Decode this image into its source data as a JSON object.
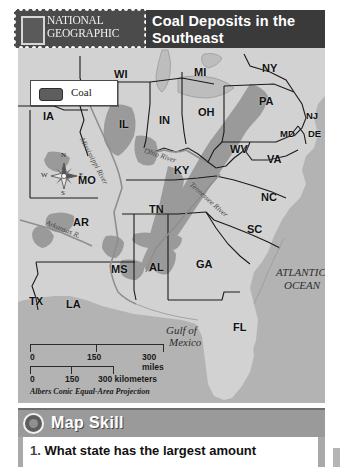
{
  "header": {
    "brand_line1": "NATIONAL",
    "brand_line2": "GEOGRAPHIC",
    "title": "Coal Deposits in the Southeast"
  },
  "legend": {
    "label": "Coal",
    "swatch_color": "#5e5e5e"
  },
  "compass": {
    "north": "N",
    "south": "S",
    "west": "W",
    "east": "E"
  },
  "scale": {
    "miles": {
      "start": "0",
      "mid": "150",
      "end": "300 miles"
    },
    "kilometers": {
      "start": "0",
      "mid": "150",
      "end": "300 kilometers"
    },
    "projection": "Albers Conic Equal-Area Projection"
  },
  "map": {
    "background_color": "#b8b8b8",
    "land_color": "#d2d2d2",
    "coal_color": "#9a9a9a",
    "water_color": "#b3b3b3",
    "states": [
      {
        "abbr": "WI",
        "x": 96,
        "y": 20
      },
      {
        "abbr": "MI",
        "x": 176,
        "y": 18
      },
      {
        "abbr": "NY",
        "x": 244,
        "y": 14
      },
      {
        "abbr": "IA",
        "x": 25,
        "y": 62
      },
      {
        "abbr": "IL",
        "x": 101,
        "y": 70
      },
      {
        "abbr": "IN",
        "x": 141,
        "y": 66
      },
      {
        "abbr": "OH",
        "x": 180,
        "y": 58
      },
      {
        "abbr": "PA",
        "x": 241,
        "y": 47
      },
      {
        "abbr": "NJ",
        "x": 288,
        "y": 62
      },
      {
        "abbr": "MD",
        "x": 262,
        "y": 80
      },
      {
        "abbr": "DE",
        "x": 290,
        "y": 80
      },
      {
        "abbr": "WV",
        "x": 212,
        "y": 95
      },
      {
        "abbr": "VA",
        "x": 249,
        "y": 105
      },
      {
        "abbr": "MO",
        "x": 60,
        "y": 126
      },
      {
        "abbr": "KY",
        "x": 156,
        "y": 116
      },
      {
        "abbr": "NC",
        "x": 243,
        "y": 143
      },
      {
        "abbr": "TN",
        "x": 131,
        "y": 155
      },
      {
        "abbr": "AR",
        "x": 55,
        "y": 168
      },
      {
        "abbr": "SC",
        "x": 229,
        "y": 175
      },
      {
        "abbr": "MS",
        "x": 93,
        "y": 215
      },
      {
        "abbr": "AL",
        "x": 131,
        "y": 213
      },
      {
        "abbr": "GA",
        "x": 178,
        "y": 210
      },
      {
        "abbr": "TX",
        "x": 11,
        "y": 247
      },
      {
        "abbr": "LA",
        "x": 48,
        "y": 250
      },
      {
        "abbr": "FL",
        "x": 215,
        "y": 273
      }
    ],
    "water_labels": [
      {
        "text": "ATLANTIC",
        "x": 258,
        "y": 218
      },
      {
        "text": "OCEAN",
        "x": 266,
        "y": 231
      },
      {
        "text": "Gulf of",
        "x": 148,
        "y": 276
      },
      {
        "text": "Mexico",
        "x": 151,
        "y": 288
      }
    ],
    "rivers": [
      {
        "name": "Mississippi River",
        "x": 68,
        "y": 88,
        "rotate": 62
      },
      {
        "name": "Ohio River",
        "x": 128,
        "y": 98,
        "rotate": 18
      },
      {
        "name": "Tennessee River",
        "x": 176,
        "y": 132,
        "rotate": 42
      },
      {
        "name": "Arkansas R.",
        "x": 30,
        "y": 170,
        "rotate": 22
      }
    ]
  },
  "skill": {
    "title": "Map Skill",
    "question_number": "1.",
    "question_text": "What state has the largest amount"
  }
}
